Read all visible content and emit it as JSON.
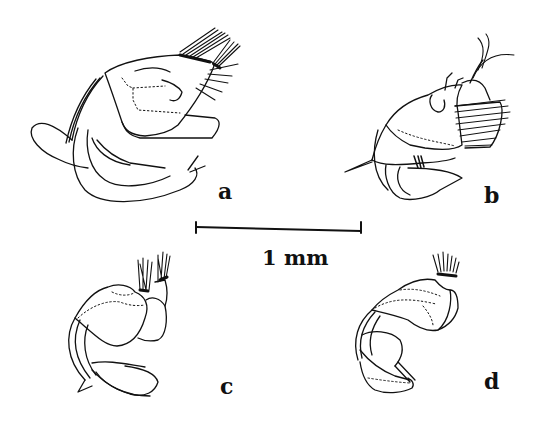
{
  "figure": {
    "panels": [
      {
        "id": "a",
        "label": "a"
      },
      {
        "id": "b",
        "label": "b"
      },
      {
        "id": "c",
        "label": "c"
      },
      {
        "id": "d",
        "label": "d"
      }
    ],
    "scale_bar": {
      "label": "1 mm"
    },
    "colors": {
      "ink": "#111111",
      "background": "#ffffff"
    }
  }
}
